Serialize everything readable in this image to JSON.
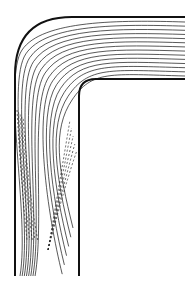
{
  "figure": {
    "type": "flow-line diagram",
    "width": 196,
    "height": 292,
    "colors": {
      "background": "#ffffff",
      "ink": "#111111"
    },
    "walls": {
      "outer": "M185,17 L72,17 Q15,17 15,75 L15,276",
      "inner": "M185,79 L96,79 Q79,79 79,96 L79,276"
    },
    "solid_line_count": 14,
    "dashed_line_count": 10
  }
}
